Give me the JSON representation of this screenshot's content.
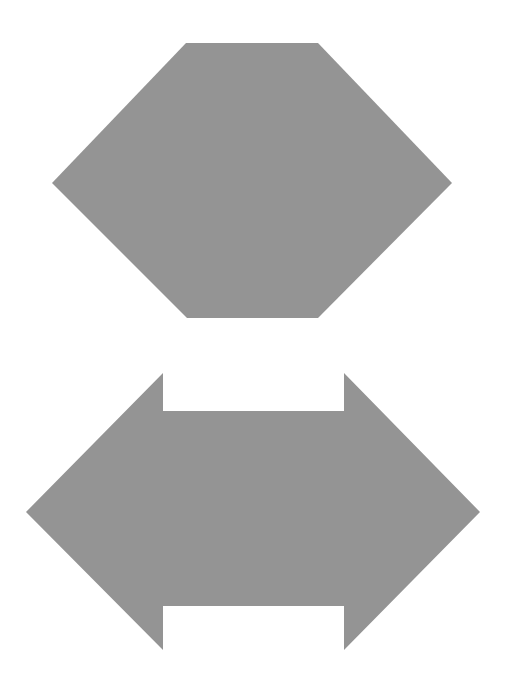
{
  "canvas": {
    "width": 507,
    "height": 677,
    "background_color": "#ffffff",
    "title": "Geometric shapes figure"
  },
  "palette": {
    "shape_fill": "#949494",
    "background": "#ffffff"
  },
  "shapes": [
    {
      "id": "hexagon",
      "name": "Hexagon",
      "type": "polygon",
      "sides": 6,
      "fill": "#949494",
      "bounding_box": {
        "x": 52,
        "y": 43,
        "width": 400,
        "height": 275
      },
      "center": {
        "x": 252,
        "y": 180
      },
      "points": "186,43 318,43 452,183 318,318 187,318 52,183",
      "vertices": [
        {
          "x": 186,
          "y": 43
        },
        {
          "x": 318,
          "y": 43
        },
        {
          "x": 452,
          "y": 183
        },
        {
          "x": 318,
          "y": 318
        },
        {
          "x": 187,
          "y": 318
        },
        {
          "x": 52,
          "y": 183
        }
      ]
    },
    {
      "id": "double-arrow",
      "name": "Double-headed arrow",
      "type": "polygon",
      "sides": 12,
      "fill": "#949494",
      "bounding_box": {
        "x": 26,
        "y": 373,
        "width": 454,
        "height": 277
      },
      "center": {
        "x": 253,
        "y": 512
      },
      "points": "163,373 163,411 344,411 344,373 480,512 344,650 344,606 163,606 163,650 26,512",
      "vertices": [
        {
          "x": 163,
          "y": 373
        },
        {
          "x": 163,
          "y": 411
        },
        {
          "x": 344,
          "y": 411
        },
        {
          "x": 344,
          "y": 373
        },
        {
          "x": 480,
          "y": 512
        },
        {
          "x": 344,
          "y": 650
        },
        {
          "x": 344,
          "y": 606
        },
        {
          "x": 163,
          "y": 606
        },
        {
          "x": 163,
          "y": 650
        },
        {
          "x": 26,
          "y": 512
        }
      ]
    }
  ]
}
